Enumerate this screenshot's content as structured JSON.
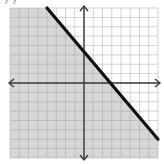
{
  "caption": "y    y",
  "chart_data": {
    "type": "line",
    "title": "",
    "subtitle": "",
    "xlabel": "",
    "ylabel": "",
    "grid": true,
    "legend": null,
    "xlim": [
      -8,
      8
    ],
    "ylim": [
      -8,
      8
    ],
    "series": [
      {
        "name": "boundary line",
        "style": "solid",
        "x": [
          -4,
          8
        ],
        "y": [
          8,
          -6
        ]
      }
    ],
    "shaded_region": "below boundary line (lower-left half-plane)",
    "annotations": [],
    "colors": {
      "shade": "#d6d6d6",
      "grid": "#9c9c9c",
      "axes": "#3a3a3a",
      "line": "#111111",
      "background": "#ffffff"
    }
  }
}
